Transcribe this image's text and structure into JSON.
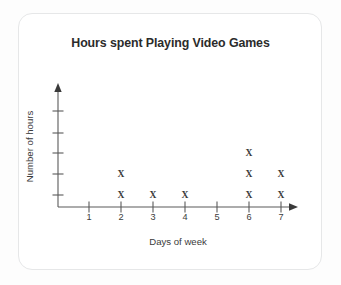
{
  "card": {
    "background_color": "#ffffff",
    "border_color": "#e6e7e8"
  },
  "chart_data": {
    "type": "scatter",
    "plot_style": "dot-plot-x-marks",
    "title": "Hours spent Playing Video Games",
    "xlabel": "Days of week",
    "ylabel": "Number of hours",
    "categories": [
      "1",
      "2",
      "3",
      "4",
      "5",
      "6",
      "7"
    ],
    "x": [
      1,
      2,
      3,
      4,
      5,
      6,
      7
    ],
    "values": [
      0,
      2,
      1,
      1,
      0,
      3,
      2
    ],
    "xtick_labels": [
      "1",
      "2",
      "3",
      "4",
      "5",
      "6",
      "7"
    ],
    "ytick_labels": [
      "",
      "",
      "",
      "",
      ""
    ],
    "ytick_count": 5,
    "xlim": [
      0.5,
      7.6
    ],
    "ylim": [
      0,
      5
    ],
    "grid": false,
    "legend": null,
    "marker": "X",
    "marker_color": "#3a3a3a",
    "axis_color": "#5a5a5a",
    "points": [
      {
        "day": "2",
        "hour_level": 1
      },
      {
        "day": "2",
        "hour_level": 2
      },
      {
        "day": "3",
        "hour_level": 1
      },
      {
        "day": "4",
        "hour_level": 1
      },
      {
        "day": "6",
        "hour_level": 1
      },
      {
        "day": "6",
        "hour_level": 2
      },
      {
        "day": "6",
        "hour_level": 3
      },
      {
        "day": "7",
        "hour_level": 1
      },
      {
        "day": "7",
        "hour_level": 2
      }
    ]
  },
  "geometry": {
    "x_positions": [
      89,
      121,
      153,
      185,
      217,
      249,
      281
    ],
    "y_levels": [
      195,
      174,
      153,
      133,
      111
    ],
    "axis_x": 58,
    "axis_y": 207
  }
}
